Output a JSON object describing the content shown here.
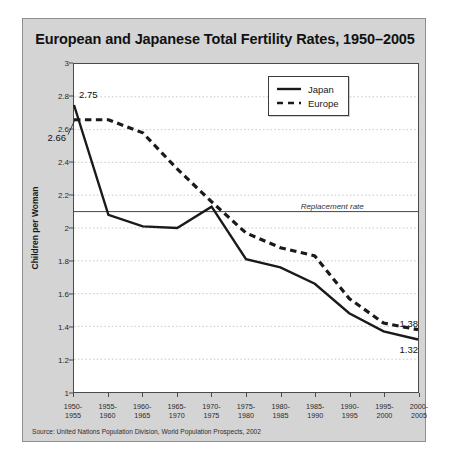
{
  "chart_data": {
    "type": "line",
    "title": "European and Japanese Total Fertility Rates, 1950–2005",
    "xlabel": "",
    "ylabel": "Children per Woman",
    "categories": [
      "1950-\n1955",
      "1955-\n1960",
      "1960-\n1965",
      "1965-\n1970",
      "1970-\n1975",
      "1975-\n1980",
      "1980-\n1985",
      "1985-\n1990",
      "1990-\n1995",
      "1995-\n2000",
      "2000-\n2005"
    ],
    "series": [
      {
        "name": "Japan",
        "style": "solid",
        "color": "#1a1a1a",
        "values": [
          2.75,
          2.08,
          2.01,
          2.0,
          2.13,
          1.81,
          1.76,
          1.66,
          1.48,
          1.37,
          1.32
        ]
      },
      {
        "name": "Europe",
        "style": "dashed",
        "color": "#1a1a1a",
        "values": [
          2.66,
          2.66,
          2.58,
          2.36,
          2.16,
          1.97,
          1.88,
          1.83,
          1.57,
          1.42,
          1.38
        ]
      }
    ],
    "ylim": [
      1,
      3
    ],
    "yticks": [
      "1",
      "1.2",
      "1.4",
      "1.6",
      "1.8",
      "2",
      "2.2",
      "2.4",
      "2.6",
      "2.8",
      "3"
    ],
    "ytick_values": [
      1,
      1.2,
      1.4,
      1.6,
      1.8,
      2,
      2.2,
      2.4,
      2.6,
      2.8,
      3
    ],
    "grid": true,
    "legend_position": "upper right",
    "annotations": [
      {
        "name": "replacement-rate-line",
        "label": "Replacement rate",
        "value": 2.1
      },
      {
        "name": "japan-start-value",
        "label": "2.75",
        "series": "Japan",
        "x_index": 0,
        "value": 2.75
      },
      {
        "name": "europe-start-value",
        "label": "2.66",
        "series": "Europe",
        "x_index": 0,
        "value": 2.66
      },
      {
        "name": "europe-end-value",
        "label": "1.38",
        "series": "Europe",
        "x_index": 10,
        "value": 1.38
      },
      {
        "name": "japan-end-value",
        "label": "1.32",
        "series": "Japan",
        "x_index": 10,
        "value": 1.32
      }
    ]
  },
  "source": {
    "note": "Source: United Nations Population Division, World Population Prospects, 2002"
  }
}
